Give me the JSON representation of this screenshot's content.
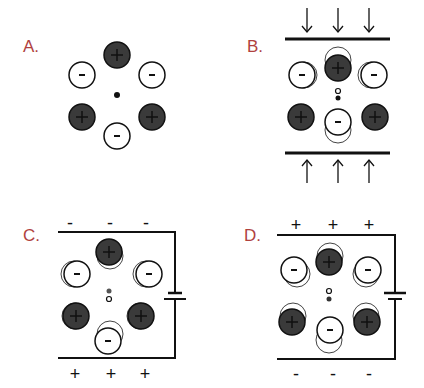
{
  "figure": {
    "colors": {
      "label": "#b0413e",
      "positive_ion": "#3a3a3a",
      "negative_ion": "#ffffff",
      "line": "#111111"
    },
    "panels": [
      {
        "id": "A",
        "label": "A.",
        "description": "Unstressed lattice, charge centers coincide"
      },
      {
        "id": "B",
        "label": "B.",
        "description": "Mechanical compression, charge centers separate",
        "arrows_top": [
          "↓",
          "↓",
          "↓"
        ],
        "arrows_bottom": [
          "↑",
          "↑",
          "↑"
        ]
      },
      {
        "id": "C",
        "label": "C.",
        "description": "Applied voltage, top plate negative",
        "top_signs": [
          "-",
          "-",
          "-"
        ],
        "bottom_signs": [
          "+",
          "+",
          "+"
        ]
      },
      {
        "id": "D",
        "label": "D.",
        "description": "Applied voltage, top plate positive",
        "top_signs": [
          "+",
          "+",
          "+"
        ],
        "bottom_signs": [
          "-",
          "-",
          "-"
        ]
      }
    ],
    "ion_labels": {
      "positive": "+",
      "negative": "-"
    }
  }
}
